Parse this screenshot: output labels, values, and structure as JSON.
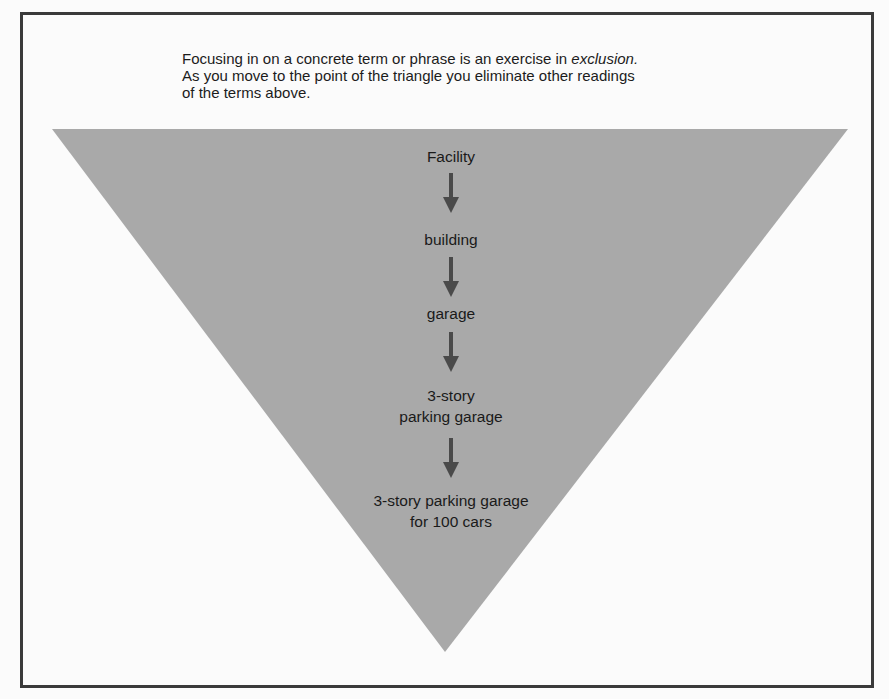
{
  "intro": {
    "line1_prefix": "Focusing in on a concrete term or phrase is an exercise in ",
    "line1_emphasis": "exclusion.",
    "line2": "As you move to the point of the triangle you eliminate other readings",
    "line3": "of the terms above."
  },
  "triangle": {
    "fill": "#a9a9a9",
    "arrow_color": "#4a4a4a",
    "levels": [
      {
        "line1": "Facility",
        "line2": ""
      },
      {
        "line1": "building",
        "line2": ""
      },
      {
        "line1": "garage",
        "line2": ""
      },
      {
        "line1": "3-story",
        "line2": "parking garage"
      },
      {
        "line1": "3-story parking garage",
        "line2": "for 100 cars"
      }
    ]
  }
}
